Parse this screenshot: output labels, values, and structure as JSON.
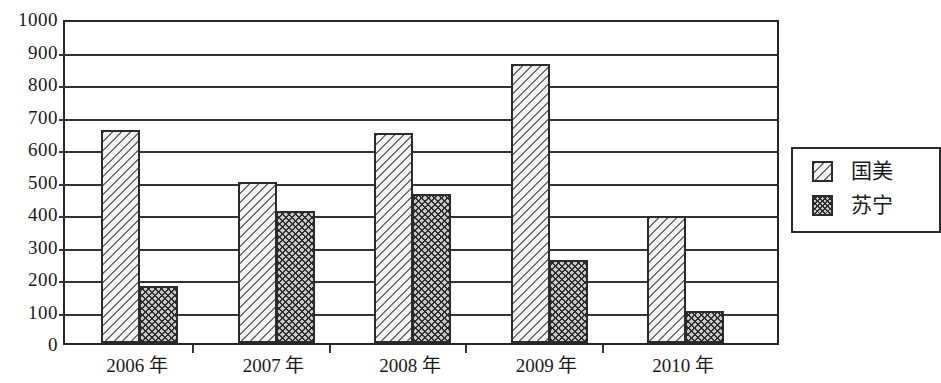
{
  "chart_data": {
    "type": "bar",
    "title": "",
    "subtitle": "",
    "xlabel": "",
    "ylabel": "",
    "categories": [
      "2006 年",
      "2007 年",
      "2008 年",
      "2009 年",
      "2010 年"
    ],
    "series": [
      {
        "name": "国美",
        "values": [
          655,
          495,
          645,
          860,
          390
        ],
        "pattern": "diagonal-hatch"
      },
      {
        "name": "苏宁",
        "values": [
          175,
          405,
          460,
          255,
          100
        ],
        "pattern": "crosshatch-dot"
      }
    ],
    "ylim": [
      0,
      1000
    ],
    "ytick_labels": [
      "1000",
      "900",
      "800",
      "700",
      "600",
      "500",
      "400",
      "300",
      "200",
      "100",
      "0"
    ],
    "ytick_values": [
      1000,
      900,
      800,
      700,
      600,
      500,
      400,
      300,
      200,
      100,
      0
    ],
    "grid": "horizontal",
    "legend_position": "right",
    "legend_entries": [
      "国美",
      "苏宁"
    ],
    "colors": {
      "axis": "#333333",
      "bar_outline": "#2b2b2b",
      "series_a_fill": "#f2f2f2",
      "series_b_fill": "#c9c9c9",
      "background": "#ffffff"
    }
  }
}
